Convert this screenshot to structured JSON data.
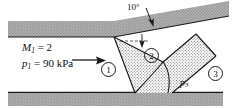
{
  "figure": {
    "type": "schematic",
    "width": 237,
    "height": 108,
    "background": "#ffffff"
  },
  "colors": {
    "wall_fill": "#a8a8a8",
    "wall_stroke": "#1a1a1a",
    "shock_zone_fill": "#cfcfcf",
    "line": "#1a1a1a",
    "text": "#101010"
  },
  "labels": {
    "angle": "10°",
    "mach": {
      "symbol": "M",
      "sub": "1",
      "eq": "= 2",
      "full": "M1 = 2"
    },
    "pressure_in": {
      "symbol": "p",
      "sub": "1",
      "eq": "= 90 kPa",
      "full": "p1 = 90 kPa"
    },
    "pressure_out": {
      "symbol": "p",
      "sub": "3",
      "full": "p3"
    }
  },
  "regions": [
    {
      "id": "1",
      "label": "1"
    },
    {
      "id": "2",
      "label": "2"
    },
    {
      "id": "3",
      "label": "3"
    }
  ],
  "icons": {
    "flow_arrow": "right-arrow-icon",
    "angle_arrow": "angle-leader-arrow-icon",
    "deflection_arrow": "deflection-leader-arrow-icon"
  }
}
